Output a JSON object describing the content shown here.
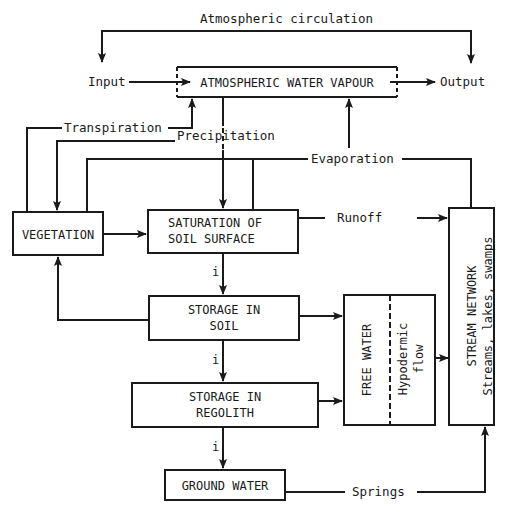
{
  "diagram": {
    "colors": {
      "line": "#1a1a1a",
      "background": "#ffffff"
    },
    "flow_labels": {
      "atmospheric_circulation": "Atmospheric circulation",
      "input": "Input",
      "output": "Output",
      "transpiration": "Transpiration",
      "precipitation": "Precipitation",
      "evaporation": "Evaporation",
      "runoff": "Runoff",
      "springs": "Springs",
      "infiltration_marker": "i"
    },
    "boxes": {
      "atmospheric_water_vapour": "ATMOSPHERIC WATER VAPOUR",
      "vegetation": "VEGETATION",
      "saturation_line1": "SATURATION OF",
      "saturation_line2": "SOIL SURFACE",
      "storage_soil_line1": "STORAGE IN",
      "storage_soil_line2": "SOIL",
      "storage_regolith_line1": "STORAGE IN",
      "storage_regolith_line2": "REGOLITH",
      "ground_water": "GROUND WATER",
      "free_water": "FREE WATER",
      "hypodermic_line1": "Hypodermic",
      "hypodermic_line2": "flow",
      "stream_network_line1": "STREAM NETWORK",
      "stream_network_line2": "Streams, lakes, swamps"
    }
  }
}
